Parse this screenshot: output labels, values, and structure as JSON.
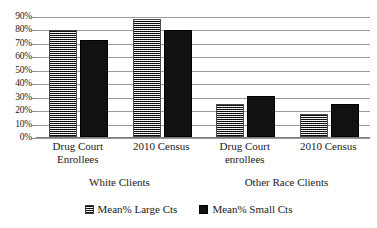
{
  "chart_data": {
    "type": "bar",
    "title": "",
    "xlabel": "",
    "ylabel": "",
    "ylim": [
      0,
      90
    ],
    "grid": true,
    "legend_position": "bottom",
    "categories": [
      "Drug Court Enrollees",
      "2010 Census",
      "Drug Court enrollees",
      "2010 Census"
    ],
    "category_lines": [
      [
        "Drug Court",
        "Enrollees"
      ],
      [
        "2010 Census",
        ""
      ],
      [
        "Drug Court",
        "enrollees"
      ],
      [
        "2010 Census",
        ""
      ]
    ],
    "groups": [
      {
        "label": "White Clients",
        "categories": [
          0,
          1
        ]
      },
      {
        "label": "Other Race Clients",
        "categories": [
          2,
          3
        ]
      }
    ],
    "series": [
      {
        "name": "Mean% Large Cts",
        "values": [
          78,
          86,
          23,
          16
        ]
      },
      {
        "name": "Mean% Small Cts",
        "values": [
          71,
          78,
          29,
          23
        ]
      }
    ],
    "ticks": [
      "0%",
      "10%",
      "20%",
      "30%",
      "40%",
      "50%",
      "60%",
      "70%",
      "80%",
      "90%"
    ],
    "tick_values": [
      0,
      10,
      20,
      30,
      40,
      50,
      60,
      70,
      80,
      90
    ]
  },
  "legend": {
    "items": [
      {
        "label": "Mean% Large Cts",
        "swatch": "large-cts-swatch-icon"
      },
      {
        "label": "Mean% Small Cts",
        "swatch": "small-cts-swatch-icon"
      }
    ]
  },
  "title_sliver": {
    "text": ""
  },
  "colors": {
    "large_cts": "#6e6e6e",
    "small_cts": "#111111",
    "gridline": "#9b9b9b",
    "text": "#1a1a1a",
    "background": "#ffffff"
  }
}
